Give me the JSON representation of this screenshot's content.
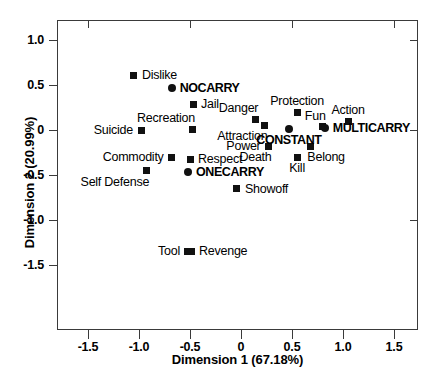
{
  "chart_data": {
    "type": "scatter",
    "title": "",
    "xlabel": "Dimension 1 (67.18%)",
    "ylabel": "Dimension 2 (20.99%)",
    "xlim": [
      -1.75,
      1.78
    ],
    "ylim": [
      -1.72,
      1.22
    ],
    "xticks": [
      "-1.5",
      "-1.0",
      "-0.5",
      "0",
      "0.5",
      "1.0",
      "1.5"
    ],
    "xtickvals": [
      -1.5,
      -1.0,
      -0.5,
      0,
      0.5,
      1.0,
      1.5
    ],
    "yticks": [
      "1.0",
      "0.5",
      "0",
      "-0.5",
      "-1.0",
      "-1.5"
    ],
    "ytickvals": [
      1.0,
      0.5,
      0,
      -0.5,
      -1.0,
      -1.5
    ],
    "grid": false,
    "legend": "none",
    "marker_color": "#111111",
    "series": [
      {
        "name": "Attributes",
        "marker": "square",
        "points": [
          {
            "label": "Dislike",
            "x": -1.05,
            "y": 0.61,
            "label_pos": "right"
          },
          {
            "label": "Jail",
            "x": -0.47,
            "y": 0.285,
            "label_pos": "right"
          },
          {
            "label": "Recreation",
            "x": -0.48,
            "y": 0.01,
            "label_pos": "above-left"
          },
          {
            "label": "Suicide",
            "x": -0.98,
            "y": 0.0,
            "label_pos": "left"
          },
          {
            "label": "Danger",
            "x": 0.14,
            "y": 0.12,
            "label_pos": "above-left"
          },
          {
            "label": "Attraction",
            "x": 0.23,
            "y": 0.055,
            "label_pos": "below-left"
          },
          {
            "label": "Protection",
            "x": 0.55,
            "y": 0.195,
            "label_pos": "above"
          },
          {
            "label": "Fun",
            "x": 0.8,
            "y": 0.035,
            "label_pos": "above-left"
          },
          {
            "label": "Action",
            "x": 1.05,
            "y": 0.095,
            "label_pos": "above"
          },
          {
            "label": "Power",
            "x": 0.27,
            "y": -0.18,
            "label_pos": "left"
          },
          {
            "label": "Belong",
            "x": 0.68,
            "y": -0.18,
            "label_pos": "below-right"
          },
          {
            "label": "Kill",
            "x": 0.55,
            "y": -0.3,
            "label_pos": "below"
          },
          {
            "label": "Death",
            "x": 0.27,
            "y": -0.18,
            "label_pos": "below-left"
          },
          {
            "label": "Commodity",
            "x": -0.68,
            "y": -0.305,
            "label_pos": "left"
          },
          {
            "label": "Respect",
            "x": -0.5,
            "y": -0.325,
            "label_pos": "right"
          },
          {
            "label": "Self Defense",
            "x": -0.93,
            "y": -0.45,
            "label_pos": "below-left"
          },
          {
            "label": "Showoff",
            "x": -0.04,
            "y": -0.655,
            "label_pos": "right"
          },
          {
            "label": "Tool",
            "x": -0.52,
            "y": -1.345,
            "label_pos": "left"
          },
          {
            "label": "Revenge",
            "x": -0.49,
            "y": -1.345,
            "label_pos": "right"
          }
        ]
      },
      {
        "name": "Carry groups",
        "marker": "circle",
        "points": [
          {
            "label": "NOCARRY",
            "x": -0.68,
            "y": 0.47,
            "label_pos": "right",
            "bold": true
          },
          {
            "label": "CONSTANT",
            "x": 0.47,
            "y": 0.01,
            "label_pos": "below",
            "bold": true
          },
          {
            "label": "MULTICARRY",
            "x": 0.82,
            "y": 0.025,
            "label_pos": "right",
            "bold": true
          },
          {
            "label": "ONECARRY",
            "x": -0.52,
            "y": -0.465,
            "label_pos": "right",
            "bold": true
          }
        ]
      }
    ]
  }
}
